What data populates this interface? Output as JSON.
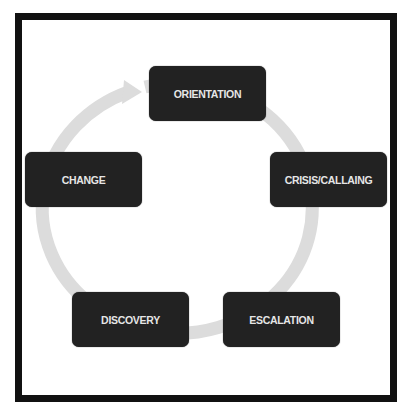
{
  "diagram": {
    "type": "cycle",
    "colors": {
      "frame": "#111111",
      "node_fill": "#222222",
      "node_text": "#e6e6e6",
      "ring": "#dcdcdc"
    },
    "nodes": [
      {
        "id": "orientation",
        "label": "ORIENTATION"
      },
      {
        "id": "crisis-calling",
        "label": "CRISIS/CALLAING"
      },
      {
        "id": "escalation",
        "label": "ESCALATION"
      },
      {
        "id": "discovery",
        "label": "DISCOVERY"
      },
      {
        "id": "change",
        "label": "CHANGE"
      }
    ],
    "cycle_order": [
      "ORIENTATION",
      "CRISIS/CALLAING",
      "ESCALATION",
      "DISCOVERY",
      "CHANGE"
    ],
    "direction": "clockwise"
  }
}
